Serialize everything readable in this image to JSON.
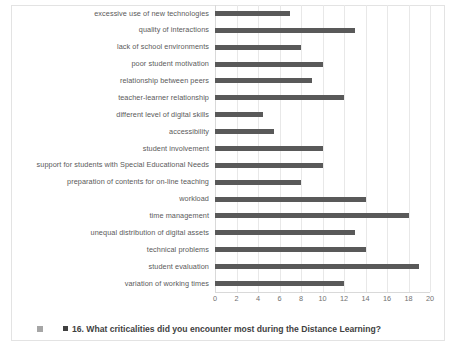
{
  "chart_data": {
    "type": "bar",
    "orientation": "horizontal",
    "title": "",
    "xlabel": "",
    "ylabel": "",
    "xlim": [
      0,
      20
    ],
    "xticks": [
      "0",
      "2",
      "4",
      "6",
      "8",
      "10",
      "12",
      "14",
      "16",
      "18",
      "20"
    ],
    "grid": true,
    "legend_position": "bottom",
    "legend": [
      "16. What criticalities did you encounter most during the Distance Learning?"
    ],
    "bar_color": "#595959",
    "gridline_color": "#e8e8e8",
    "categories": [
      "excessive use of new technologies",
      "quality of interactions",
      "lack of school environments",
      "poor student motivation",
      "relationship between peers",
      "teacher-learner relationship",
      "different level of digital skills",
      "accessibility",
      "student involvement",
      "support for students with Special Educational Needs",
      "preparation of contents for on-line teaching",
      "workload",
      "time management",
      "unequal distribution of digital assets",
      "technical problems",
      "student evaluation",
      "variation of working times"
    ],
    "values": [
      7,
      13,
      8,
      10,
      9,
      12,
      4.5,
      5.5,
      10,
      10,
      8,
      14,
      18,
      13,
      14,
      19,
      12
    ]
  },
  "legend": {
    "marker_outer_name": "legend-swatch-outer",
    "marker_inner_name": "legend-swatch-inner",
    "text": "16. What criticalities did you encounter most during the Distance Learning?"
  }
}
